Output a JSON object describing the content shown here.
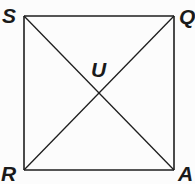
{
  "diagram": {
    "type": "geometry",
    "shape": "square",
    "stroke_color": "#1e1e1e",
    "label_color": "#1a1a1a",
    "vertices": [
      {
        "name": "S",
        "position": "top-left",
        "x": 24,
        "y": 16
      },
      {
        "name": "Q",
        "position": "top-right",
        "x": 174,
        "y": 16
      },
      {
        "name": "A",
        "position": "bottom-right",
        "x": 174,
        "y": 170
      },
      {
        "name": "R",
        "position": "bottom-left",
        "x": 24,
        "y": 170
      }
    ],
    "intersection": {
      "name": "U",
      "x": 99,
      "y": 93
    },
    "edges": [
      "SQ",
      "QA",
      "AR",
      "RS"
    ],
    "diagonals": [
      "SA",
      "QR"
    ],
    "labels": {
      "S": "S",
      "Q": "Q",
      "R": "R",
      "A": "A",
      "U": "U"
    }
  }
}
